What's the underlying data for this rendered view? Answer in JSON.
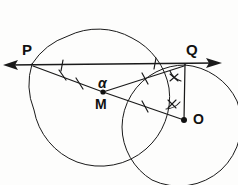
{
  "figure": {
    "background_color": "#fdfdfc",
    "ink_color": "#1a1a1a",
    "labels": {
      "P": "P",
      "Q": "Q",
      "O": "O",
      "M": "M",
      "alpha": "α"
    },
    "points": [
      {
        "name": "P",
        "label": "P",
        "x": 32,
        "y": 64,
        "dot": false
      },
      {
        "name": "Q",
        "label": "Q",
        "x": 185,
        "y": 65,
        "dot": false
      },
      {
        "name": "M",
        "label": "M",
        "x": 103,
        "y": 92,
        "dot": true
      },
      {
        "name": "O",
        "label": "O",
        "x": 184,
        "y": 120,
        "dot": true
      }
    ],
    "circles": [
      {
        "name": "big-circle",
        "center_label": "M",
        "cx": 101,
        "cy": 96,
        "r": 69
      },
      {
        "name": "small-circle",
        "center_label": "O",
        "cx": 184,
        "cy": 120,
        "r": 63
      }
    ],
    "lines": [
      {
        "name": "secant-line-PQ",
        "from": "P-arrow",
        "to": "Q-arrow",
        "double_arrow": true
      },
      {
        "name": "segment-P-M",
        "from": "P",
        "to": "M"
      },
      {
        "name": "segment-M-O",
        "from": "M",
        "to": "O"
      },
      {
        "name": "segment-M-Q",
        "from": "M",
        "to": "Q"
      },
      {
        "name": "segment-Q-O",
        "from": "Q",
        "to": "O"
      }
    ],
    "tick_marks": [
      {
        "name": "tick-on-PQ-left",
        "count": 1
      },
      {
        "name": "tick-on-PM-upper",
        "count": 1
      },
      {
        "name": "tick-on-PM-lower",
        "count": 1
      },
      {
        "name": "tick-on-MO",
        "count": 1
      },
      {
        "name": "tick-on-MQ",
        "count": 1
      },
      {
        "name": "tick-on-PQ-right",
        "count": 1
      }
    ],
    "angle_marks": [
      {
        "name": "angle-alpha-at-M",
        "label": "α",
        "vertex": "M"
      },
      {
        "name": "angle-double-tick-at-Q",
        "label": "x",
        "vertex": "Q"
      },
      {
        "name": "angle-double-tick-at-O",
        "label": "x",
        "vertex": "O"
      }
    ]
  }
}
